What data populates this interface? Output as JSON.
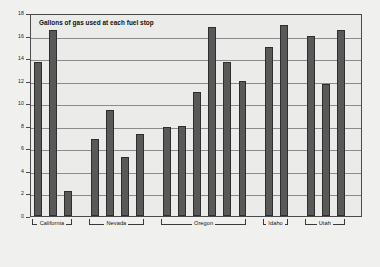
{
  "chart_data": {
    "type": "bar",
    "title": "Gallons of gas used at each fuel stop",
    "xlabel": "",
    "ylabel": "",
    "ylim": [
      0,
      18
    ],
    "yticks": [
      0,
      2,
      4,
      6,
      8,
      10,
      12,
      14,
      16,
      18
    ],
    "ytick_labels": [
      "0",
      "2",
      "4",
      "6",
      "8",
      "10",
      "12",
      "14",
      "16",
      "18"
    ],
    "grid": true,
    "legend": "none",
    "bar_color": "#595959",
    "plot_background": "#ebebe9",
    "figure_background": "#f0f0ee",
    "categories": [
      "California 1",
      "California 2",
      "California 3",
      "Nevada 1",
      "Nevada 2",
      "Nevada 3",
      "Nevada 4",
      "Oregon 1",
      "Oregon 2",
      "Oregon 3",
      "Oregon 4",
      "Oregon 5",
      "Oregon 6",
      "Idaho 1",
      "Idaho 2",
      "Utah 1",
      "Utah 2",
      "Utah 3"
    ],
    "values": [
      13.7,
      16.5,
      2.2,
      6.85,
      9.4,
      5.2,
      7.25,
      7.9,
      8.0,
      11.0,
      16.75,
      13.7,
      12.0,
      15.0,
      16.95,
      15.95,
      11.75,
      16.5
    ],
    "groups": [
      {
        "label": "California",
        "start_index": 0,
        "count": 3
      },
      {
        "label": "Nevada",
        "start_index": 3,
        "count": 4
      },
      {
        "label": "Oregon",
        "start_index": 7,
        "count": 6
      },
      {
        "label": "Idaho",
        "start_index": 13,
        "count": 2
      },
      {
        "label": "Utah",
        "start_index": 15,
        "count": 3
      }
    ]
  }
}
